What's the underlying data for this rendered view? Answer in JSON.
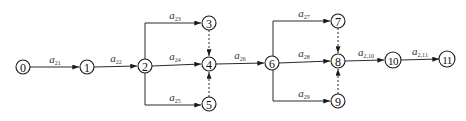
{
  "diagram": {
    "type": "activity-on-arrow network",
    "nodes": [
      {
        "id": "0",
        "label": "0",
        "x": 23,
        "y": 67
      },
      {
        "id": "1",
        "label": "1",
        "x": 87,
        "y": 67
      },
      {
        "id": "2",
        "label": "2",
        "x": 145,
        "y": 66
      },
      {
        "id": "3",
        "label": "3",
        "x": 209,
        "y": 23
      },
      {
        "id": "4",
        "label": "4",
        "x": 209,
        "y": 64
      },
      {
        "id": "5",
        "label": "5",
        "x": 209,
        "y": 104
      },
      {
        "id": "6",
        "label": "6",
        "x": 272,
        "y": 63
      },
      {
        "id": "7",
        "label": "7",
        "x": 338,
        "y": 21
      },
      {
        "id": "8",
        "label": "8",
        "x": 338,
        "y": 61
      },
      {
        "id": "9",
        "label": "9",
        "x": 338,
        "y": 101
      },
      {
        "id": "10",
        "label": "10",
        "x": 393,
        "y": 60
      },
      {
        "id": "11",
        "label": "11",
        "x": 447,
        "y": 59
      }
    ],
    "edges": [
      {
        "from": "0",
        "to": "1",
        "label_base": "a",
        "label_sub": "21",
        "dashed": false
      },
      {
        "from": "1",
        "to": "2",
        "label_base": "a",
        "label_sub": "22",
        "dashed": false
      },
      {
        "from": "2",
        "to": "3",
        "label_base": "a",
        "label_sub": "23",
        "dashed": false
      },
      {
        "from": "2",
        "to": "4",
        "label_base": "a",
        "label_sub": "24",
        "dashed": false
      },
      {
        "from": "2",
        "to": "5",
        "label_base": "a",
        "label_sub": "25",
        "dashed": false
      },
      {
        "from": "3",
        "to": "4",
        "label_base": "",
        "label_sub": "",
        "dashed": true
      },
      {
        "from": "5",
        "to": "4",
        "label_base": "",
        "label_sub": "",
        "dashed": true
      },
      {
        "from": "4",
        "to": "6",
        "label_base": "a",
        "label_sub": "26",
        "dashed": false
      },
      {
        "from": "6",
        "to": "7",
        "label_base": "a",
        "label_sub": "27",
        "dashed": false
      },
      {
        "from": "6",
        "to": "8",
        "label_base": "a",
        "label_sub": "28",
        "dashed": false
      },
      {
        "from": "6",
        "to": "9",
        "label_base": "a",
        "label_sub": "29",
        "dashed": false
      },
      {
        "from": "7",
        "to": "8",
        "label_base": "",
        "label_sub": "",
        "dashed": true
      },
      {
        "from": "9",
        "to": "8",
        "label_base": "",
        "label_sub": "",
        "dashed": true
      },
      {
        "from": "8",
        "to": "10",
        "label_base": "a",
        "label_sub": "2,10",
        "dashed": false
      },
      {
        "from": "10",
        "to": "11",
        "label_base": "a",
        "label_sub": "2,11",
        "dashed": false
      }
    ],
    "colors": {
      "line": "#2a2a2a",
      "node_stroke": "#1a1a1a",
      "label": "#333333",
      "background": "#ffffff"
    }
  }
}
